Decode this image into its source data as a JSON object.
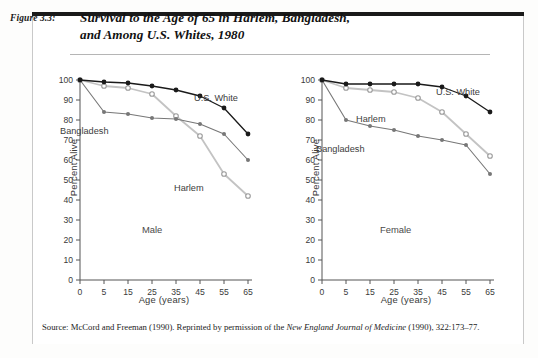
{
  "figure": {
    "number_label": "Figure 3.3:",
    "title_line1": "Survival to the Age of 65 in Harlem, Bangladesh,",
    "title_line2": "and Among U.S. Whites, 1980",
    "source_prefix": "Source: McCord and Freeman (1990). Reprinted by permission of the ",
    "source_italic": "New England Journal of Medicine",
    "source_suffix": " (1990), 322:173–77."
  },
  "colors": {
    "us_white": "#1a1a1a",
    "bangladesh": "#777777",
    "harlem": "#c3c3c3",
    "axis": "#555555",
    "text": "#3a3a3a",
    "page_bg": "#ffffff",
    "rule": "#1a1a1a"
  },
  "axis": {
    "y_title": "Percent Alive",
    "x_title": "Age (years)",
    "y_ticks": [
      "0",
      "10",
      "20",
      "30",
      "40",
      "50",
      "60",
      "70",
      "80",
      "90",
      "100"
    ],
    "x_ticks": [
      "0",
      "5",
      "15",
      "25",
      "35",
      "45",
      "55",
      "65"
    ]
  },
  "panels": {
    "male_label": "Male",
    "female_label": "Female"
  },
  "series_labels": {
    "us_white": "U.S. White",
    "bangladesh": "Bangladesh",
    "harlem": "Harlem"
  },
  "chart_data": [
    {
      "type": "line",
      "title": "Male",
      "xlabel": "Age (years)",
      "ylabel": "Percent Alive",
      "x": [
        0,
        5,
        15,
        25,
        35,
        45,
        55,
        65
      ],
      "xlim": [
        0,
        7
      ],
      "ylim": [
        0,
        100
      ],
      "grid": false,
      "legend": "inline-annotations",
      "series": [
        {
          "name": "U.S. White",
          "values": [
            100,
            99,
            98.5,
            97,
            95,
            92,
            86,
            73
          ]
        },
        {
          "name": "Bangladesh",
          "values": [
            100,
            84,
            83,
            81,
            80.5,
            78,
            73,
            60
          ]
        },
        {
          "name": "Harlem",
          "values": [
            100,
            97,
            96,
            93,
            82,
            72,
            53,
            42
          ]
        }
      ]
    },
    {
      "type": "line",
      "title": "Female",
      "xlabel": "Age (years)",
      "ylabel": "Percent Alive",
      "x": [
        0,
        5,
        15,
        25,
        35,
        45,
        55,
        65
      ],
      "xlim": [
        0,
        7
      ],
      "ylim": [
        0,
        100
      ],
      "grid": false,
      "legend": "inline-annotations",
      "series": [
        {
          "name": "U.S. White",
          "values": [
            100,
            98,
            98,
            98,
            98,
            96.5,
            92,
            84
          ]
        },
        {
          "name": "Bangladesh",
          "values": [
            100,
            80,
            77,
            75,
            72,
            70,
            67.5,
            53
          ]
        },
        {
          "name": "Harlem",
          "values": [
            100,
            96,
            95,
            94,
            91,
            84,
            73,
            62
          ]
        }
      ]
    }
  ]
}
